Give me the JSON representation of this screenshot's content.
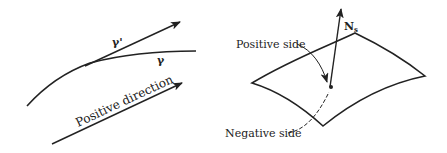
{
  "left_diagram": {
    "tangent_label": "γ'",
    "curve_label": "γ",
    "direction_label": "Positive direction"
  },
  "right_diagram": {
    "normal_label_main": "N",
    "normal_label_sub": "s",
    "positive_side_label": "Positive side",
    "negative_side_label": "Negative side"
  },
  "colors": {
    "stroke": "#222222",
    "background": "#ffffff"
  }
}
